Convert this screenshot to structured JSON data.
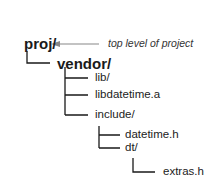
{
  "diagram": {
    "root": {
      "label": "proj/",
      "annotation": "top level of project"
    },
    "nodes": [
      {
        "label": "vendor/",
        "depth": 1
      },
      {
        "label": "lib/",
        "depth": 2
      },
      {
        "label": "libdatetime.a",
        "depth": 2
      },
      {
        "label": "include/",
        "depth": 2
      },
      {
        "label": "datetime.h",
        "depth": 3
      },
      {
        "label": "dt/",
        "depth": 3
      },
      {
        "label": "extras.h",
        "depth": 4
      }
    ]
  },
  "colors": {
    "line": "#1a1a1a",
    "arrow": "#888888",
    "text": "#1a1a1a"
  }
}
